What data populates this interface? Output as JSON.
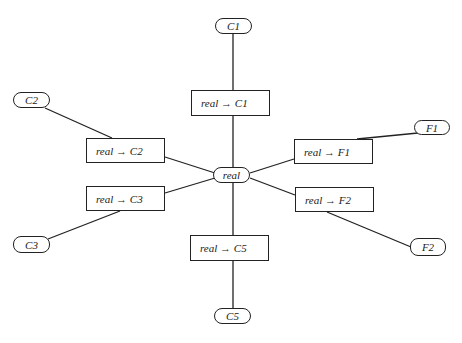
{
  "diagram": {
    "type": "star-graph",
    "center": {
      "id": "real",
      "label": "real"
    },
    "leaves": [
      {
        "id": "C1",
        "label": "C1"
      },
      {
        "id": "C2",
        "label": "C2"
      },
      {
        "id": "C3",
        "label": "C3"
      },
      {
        "id": "C5",
        "label": "C5"
      },
      {
        "id": "F1",
        "label": "F1"
      },
      {
        "id": "F2",
        "label": "F2"
      }
    ],
    "transforms": [
      {
        "id": "real-C1",
        "label": "real → C1"
      },
      {
        "id": "real-C2",
        "label": "real → C2"
      },
      {
        "id": "real-C3",
        "label": "real → C3"
      },
      {
        "id": "real-C5",
        "label": "real → C5"
      },
      {
        "id": "real-F1",
        "label": "real → F1"
      },
      {
        "id": "real-F2",
        "label": "real → F2"
      }
    ],
    "edges": [
      [
        "real",
        "real-C1"
      ],
      [
        "real-C1",
        "C1"
      ],
      [
        "real",
        "real-C2"
      ],
      [
        "real-C2",
        "C2"
      ],
      [
        "real",
        "real-C3"
      ],
      [
        "real-C3",
        "C3"
      ],
      [
        "real",
        "real-C5"
      ],
      [
        "real-C5",
        "C5"
      ],
      [
        "real",
        "real-F1"
      ],
      [
        "real-F1",
        "F1"
      ],
      [
        "real",
        "real-F2"
      ],
      [
        "real-F2",
        "F2"
      ]
    ]
  }
}
